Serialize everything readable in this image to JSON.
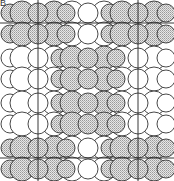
{
  "panel_label": "B",
  "colors": {
    "stroke": "#333333",
    "fill_shaded_fg": "#9a9a9a",
    "fill_shaded_bg": "#e6e6e6",
    "fill_plain": "#ffffff",
    "cell_line": "#222222"
  },
  "figure": {
    "width": 174,
    "height": 181,
    "bands": [
      {
        "cy": 23,
        "shaded_clusters": [
          0,
          2
        ]
      },
      {
        "cy": 68,
        "shaded_clusters": [
          1
        ]
      },
      {
        "cy": 113,
        "shaded_clusters": [
          1
        ]
      },
      {
        "cy": 158,
        "shaded_clusters": [
          0,
          2
        ]
      }
    ],
    "cluster_centers_x": [
      38,
      88,
      138
    ],
    "cluster_motif": [
      {
        "dx": -28,
        "dy": -10,
        "r": 9
      },
      {
        "dx": -16,
        "dy": -10,
        "r": 12
      },
      {
        "dx": 16,
        "dy": -10,
        "r": 12
      },
      {
        "dx": 28,
        "dy": -10,
        "r": 9
      },
      {
        "dx": -28,
        "dy": 11,
        "r": 9
      },
      {
        "dx": -16,
        "dy": 11,
        "r": 12
      },
      {
        "dx": 16,
        "dy": 11,
        "r": 12
      },
      {
        "dx": 28,
        "dy": 11,
        "r": 9
      },
      {
        "dx": 0,
        "dy": -10,
        "r": 10
      },
      {
        "dx": 0,
        "dy": 11,
        "r": 10
      }
    ],
    "unit_cell": {
      "x1": 38,
      "x2": 138,
      "y1": 23,
      "y2": 158,
      "extend_top": 0,
      "extend_bottom": 181
    }
  }
}
